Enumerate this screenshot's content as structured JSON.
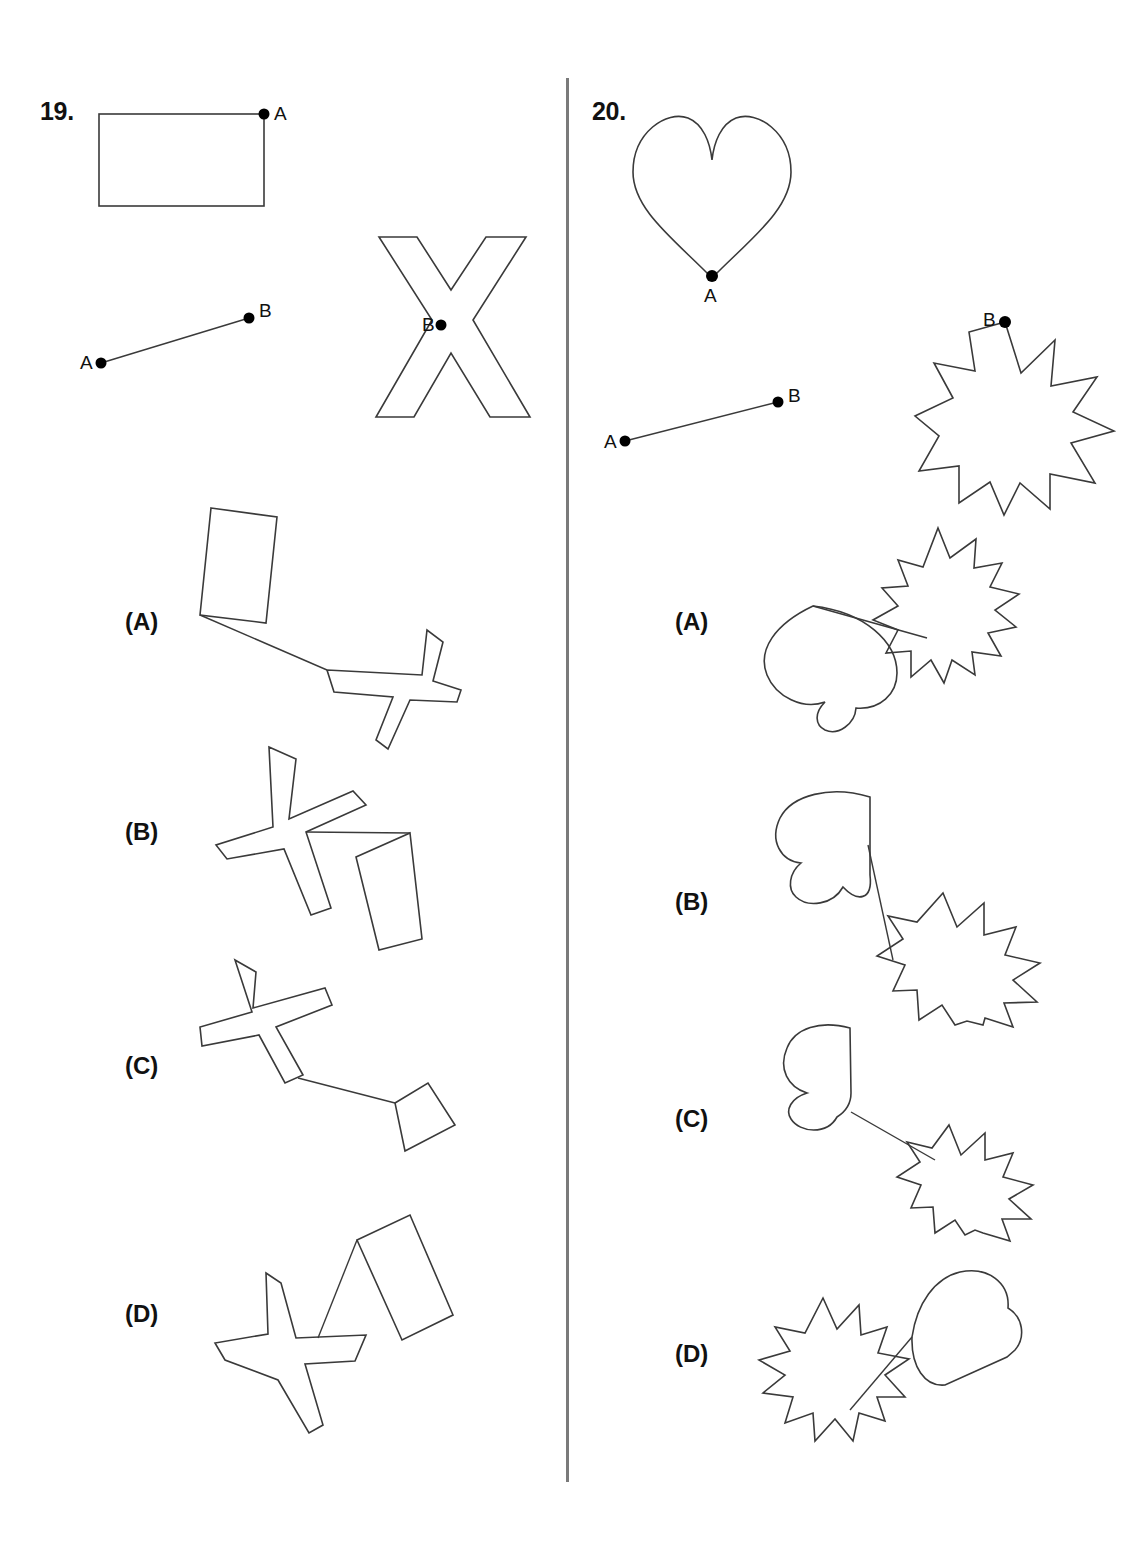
{
  "page": {
    "width": 1128,
    "height": 1541,
    "background_color": "#ffffff",
    "stroke_color": "#3a3a3a",
    "divider_color": "#7a7a7a"
  },
  "questions": [
    {
      "number": "19.",
      "prompt_shapes": [
        {
          "name": "rectangle",
          "point_label": "A"
        },
        {
          "name": "line-segment",
          "point_labels": [
            "A",
            "B"
          ]
        },
        {
          "name": "x-cross",
          "point_label": "B"
        }
      ],
      "options": [
        {
          "label": "(A)",
          "shapes": [
            "rectangle",
            "line-segment",
            "x-cross"
          ]
        },
        {
          "label": "(B)",
          "shapes": [
            "x-cross",
            "line-segment",
            "rectangle"
          ]
        },
        {
          "label": "(C)",
          "shapes": [
            "x-cross",
            "line-segment",
            "rectangle"
          ]
        },
        {
          "label": "(D)",
          "shapes": [
            "x-cross",
            "line-segment",
            "rectangle"
          ]
        }
      ]
    },
    {
      "number": "20.",
      "prompt_shapes": [
        {
          "name": "heart",
          "point_label": "A"
        },
        {
          "name": "line-segment",
          "point_labels": [
            "A",
            "B"
          ]
        },
        {
          "name": "star-13-point",
          "point_label": "B"
        }
      ],
      "options": [
        {
          "label": "(A)",
          "shapes": [
            "heart",
            "line-segment",
            "star-13-point"
          ]
        },
        {
          "label": "(B)",
          "shapes": [
            "heart",
            "line-segment",
            "star-13-point"
          ]
        },
        {
          "label": "(C)",
          "shapes": [
            "heart",
            "line-segment",
            "star-13-point"
          ]
        },
        {
          "label": "(D)",
          "shapes": [
            "heart",
            "line-segment",
            "star-13-point"
          ]
        }
      ]
    }
  ],
  "point_labels": {
    "a": "A",
    "b": "B"
  }
}
